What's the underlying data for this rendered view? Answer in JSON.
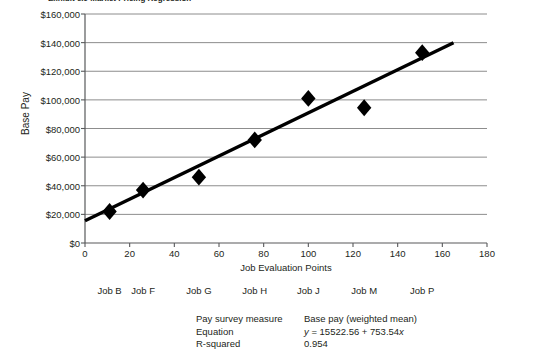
{
  "clipped_title": "Exhibit 6.9   Market Pricing Regression",
  "chart_data": {
    "type": "scatter",
    "title": "",
    "xlabel": "Job Evaluation Points",
    "ylabel": "Base Pay",
    "xlim": [
      0,
      180
    ],
    "ylim": [
      0,
      160000
    ],
    "xticks": [
      0,
      20,
      40,
      60,
      80,
      100,
      120,
      140,
      160,
      180
    ],
    "xticklabels": [
      "0",
      "20",
      "40",
      "60",
      "80",
      "100",
      "120",
      "140",
      "160",
      "180"
    ],
    "yticks": [
      0,
      20000,
      40000,
      60000,
      80000,
      100000,
      120000,
      140000,
      160000
    ],
    "yticklabels": [
      "$0",
      "$20,000",
      "$40,000",
      "$60,000",
      "$80,000",
      "$100,000",
      "$120,000",
      "$140,000",
      "$160,000"
    ],
    "grid": "horizontal",
    "legend": "none",
    "marker": "diamond",
    "marker_color": "#000000",
    "points": [
      {
        "label": "Job B",
        "x": 11,
        "y": 22000
      },
      {
        "label": "Job F",
        "x": 26,
        "y": 37000
      },
      {
        "label": "Job G",
        "x": 51,
        "y": 46000
      },
      {
        "label": "Job H",
        "x": 76,
        "y": 72000
      },
      {
        "label": "Job J",
        "x": 100,
        "y": 101000
      },
      {
        "label": "Job M",
        "x": 125,
        "y": 94500
      },
      {
        "label": "Job P",
        "x": 151,
        "y": 133000
      }
    ],
    "trendline": {
      "type": "linear",
      "intercept": 15522.56,
      "slope": 753.54,
      "x_start": 0,
      "x_end": 165,
      "color": "#000000"
    },
    "point_labels": [
      "Job B",
      "Job F",
      "Job G",
      "Job H",
      "Job J",
      "Job M",
      "Job P"
    ]
  },
  "stats": {
    "rows": [
      {
        "key": "Pay survey measure",
        "value": "Base pay (weighted mean)",
        "italic_lead": ""
      },
      {
        "key": "Equation",
        "value": "= 15522.56 +  753.54",
        "italic_lead": "y",
        "italic_trail": "x"
      },
      {
        "key": "R-squared",
        "value": "0.954",
        "italic_lead": ""
      }
    ],
    "row0_key": "Pay survey measure",
    "row0_val": "Base pay (weighted mean)",
    "row1_key": "Equation",
    "row1_val_pre": "y",
    "row1_val_mid": " = 15522.56 +  753.54",
    "row1_val_post": "x",
    "row2_key": "R-squared",
    "row2_val": "0.954"
  },
  "colors": {
    "ink": "#231f20",
    "grid": "#808080",
    "axis": "#58595b",
    "series": "#000000"
  }
}
